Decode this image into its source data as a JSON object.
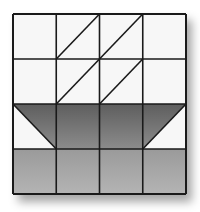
{
  "block": {
    "name": "Basket quilt block",
    "grid": {
      "rows": 4,
      "cols": 4
    },
    "origin": {
      "x": 13,
      "y": 14
    },
    "cell": {
      "w": 43.25,
      "h": 45
    },
    "colors": {
      "background": "#f7f7f7",
      "line": "#1a1a1a",
      "dark_top": "#5e5e5e",
      "dark_bottom": "#8c8c8c",
      "medium_top": "#9a9a9a",
      "medium_bottom": "#b4b4b4",
      "shadow": "#888888"
    },
    "cells": [
      [
        {
          "type": "plain",
          "fill": "light"
        },
        {
          "type": "diag-up",
          "fill": "light"
        },
        {
          "type": "diag-up",
          "fill": "light"
        },
        {
          "type": "plain",
          "fill": "light"
        }
      ],
      [
        {
          "type": "plain",
          "fill": "light"
        },
        {
          "type": "diag-up",
          "fill": "light"
        },
        {
          "type": "diag-up",
          "fill": "light"
        },
        {
          "type": "plain",
          "fill": "light"
        }
      ],
      [
        {
          "type": "tri-upper-right",
          "fill": "dark"
        },
        {
          "type": "plain",
          "fill": "dark"
        },
        {
          "type": "plain",
          "fill": "dark"
        },
        {
          "type": "tri-upper-left",
          "fill": "dark"
        }
      ],
      [
        {
          "type": "plain",
          "fill": "medium"
        },
        {
          "type": "plain",
          "fill": "medium"
        },
        {
          "type": "plain",
          "fill": "medium"
        },
        {
          "type": "plain",
          "fill": "medium"
        }
      ]
    ]
  }
}
